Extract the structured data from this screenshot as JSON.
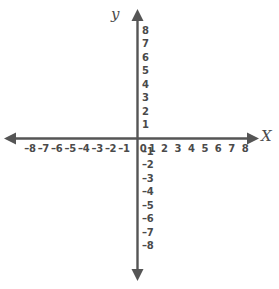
{
  "figure": {
    "kind": "cartesian-coordinate-plane",
    "background_color": "#ffffff",
    "axis_color": "#555555",
    "label_color": "#4a4a4a"
  },
  "axis_names": {
    "x": "X",
    "y": "y"
  },
  "chart_data": {
    "type": "scatter",
    "title": "",
    "subtitle": "",
    "xlabel": "X",
    "ylabel": "y",
    "xlim": [
      -8,
      8
    ],
    "ylim": [
      -8,
      8
    ],
    "grid": false,
    "legend": null,
    "annotations": [],
    "series": [],
    "x_ticks": [
      {
        "value": -8,
        "label": "–8"
      },
      {
        "value": -7,
        "label": "–7"
      },
      {
        "value": -6,
        "label": "–6"
      },
      {
        "value": -5,
        "label": "–5"
      },
      {
        "value": -4,
        "label": "–4"
      },
      {
        "value": -3,
        "label": "–3"
      },
      {
        "value": -2,
        "label": "–2"
      },
      {
        "value": -1,
        "label": "–1"
      },
      {
        "value": 0,
        "label": "0"
      },
      {
        "value": 1,
        "label": "1"
      },
      {
        "value": 2,
        "label": "2"
      },
      {
        "value": 3,
        "label": "3"
      },
      {
        "value": 4,
        "label": "4"
      },
      {
        "value": 5,
        "label": "5"
      },
      {
        "value": 6,
        "label": "6"
      },
      {
        "value": 7,
        "label": "7"
      },
      {
        "value": 8,
        "label": "8"
      }
    ],
    "y_ticks": [
      {
        "value": 8,
        "label": "8"
      },
      {
        "value": 7,
        "label": "7"
      },
      {
        "value": 6,
        "label": "6"
      },
      {
        "value": 5,
        "label": "5"
      },
      {
        "value": 4,
        "label": "4"
      },
      {
        "value": 3,
        "label": "3"
      },
      {
        "value": 2,
        "label": "2"
      },
      {
        "value": 1,
        "label": "1"
      },
      {
        "value": -1,
        "label": "–1"
      },
      {
        "value": -2,
        "label": "–2"
      },
      {
        "value": -3,
        "label": "–3"
      },
      {
        "value": -4,
        "label": "–4"
      },
      {
        "value": -5,
        "label": "–5"
      },
      {
        "value": -6,
        "label": "–6"
      },
      {
        "value": -7,
        "label": "–7"
      },
      {
        "value": -8,
        "label": "–8"
      }
    ]
  }
}
